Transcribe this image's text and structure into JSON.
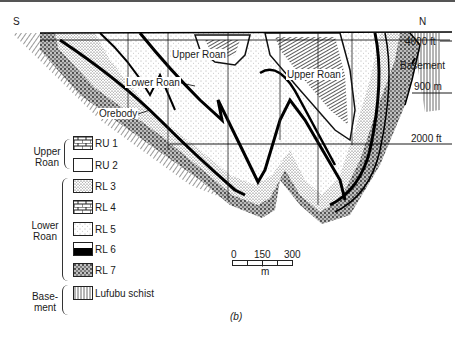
{
  "diagram": {
    "type": "geological-cross-section",
    "orientation": {
      "left": "S",
      "right": "N"
    },
    "labels": {
      "upper_roan_1": "Upper Roan",
      "upper_roan_2": "Upper Roan",
      "lower_roan": "Lower Roan",
      "orebody": "Orebody",
      "basement": "Basement"
    },
    "elevations": {
      "top": "4000 ft",
      "mid": "900 m",
      "bottom": "2000 ft"
    },
    "caption": "(b)"
  },
  "legend": {
    "groups": [
      {
        "name": "Upper\nRoan",
        "name_line1": "Upper",
        "name_line2": "Roan",
        "items": [
          {
            "code": "RU 1",
            "pattern": "brick"
          },
          {
            "code": "RU 2",
            "pattern": "blank"
          }
        ]
      },
      {
        "name_line1": "Lower",
        "name_line2": "Roan",
        "items": [
          {
            "code": "RL 3",
            "pattern": "dense-stipple"
          },
          {
            "code": "RL 4",
            "pattern": "brick"
          },
          {
            "code": "RL 5",
            "pattern": "sparse-stipple"
          },
          {
            "code": "RL 6",
            "pattern": "half-black"
          },
          {
            "code": "RL 7",
            "pattern": "coarse-stipple"
          }
        ]
      },
      {
        "name_line1": "Base-",
        "name_line2": "ment",
        "items": [
          {
            "code": "Lufubu schist",
            "pattern": "vertical-hatch"
          }
        ]
      }
    ]
  },
  "scale_bar": {
    "ticks": [
      "0",
      "150",
      "300"
    ],
    "unit": "m"
  }
}
